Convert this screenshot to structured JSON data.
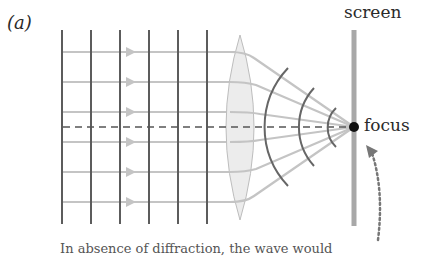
{
  "figure": {
    "panel_label": "(a)",
    "screen_label": "screen",
    "focus_label": "focus",
    "caption_partial": "In absence of diffraction, the wave would",
    "colors": {
      "grid_lines": "#5a5a5a",
      "rays": "#c2c2c2",
      "lens_fill": "#ececec",
      "lens_stroke": "#bdbdbd",
      "wavefronts": "#6a6a6a",
      "axis_dashed": "#555555",
      "screen_bar": "#a8a8a8",
      "focus_dot": "#111111",
      "dotted_arrow": "#777777"
    },
    "elements": {
      "incoming_wavefront_count": 6,
      "incoming_ray_count": 6,
      "converging_wavefront_count": 3
    }
  }
}
